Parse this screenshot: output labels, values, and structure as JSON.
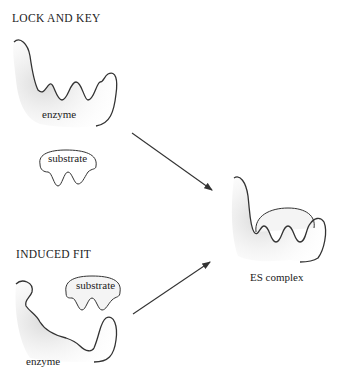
{
  "sections": {
    "lock_and_key": {
      "title": "LOCK AND KEY",
      "enzyme_label": "enzyme",
      "substrate_label": "substrate"
    },
    "induced_fit": {
      "title": "INDUCED FIT",
      "enzyme_label": "enzyme",
      "substrate_label": "substrate"
    },
    "result": {
      "label": "ES complex"
    }
  }
}
